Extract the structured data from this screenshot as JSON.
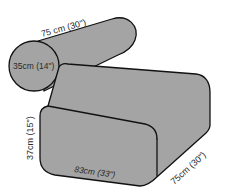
{
  "diagram": {
    "title": "",
    "fill_color": "#a4a4a4",
    "stroke_color": "#111111",
    "bolster": {
      "length_label": "75 cm (30\")",
      "diameter_label": "35cm (14\")"
    },
    "ottoman": {
      "height_label": "37cm (15\")",
      "width_label": "83cm (33\")",
      "depth_label": "75cm (30\")"
    }
  }
}
